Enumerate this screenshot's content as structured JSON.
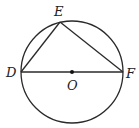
{
  "diagram": {
    "points": {
      "D": {
        "label": "D"
      },
      "E": {
        "label": "E"
      },
      "F": {
        "label": "F"
      },
      "O": {
        "label": "O"
      }
    },
    "segments": [
      "DE",
      "EF",
      "DF"
    ],
    "colors": {
      "stroke": "#2a2a2a",
      "background": "#ffffff"
    }
  }
}
